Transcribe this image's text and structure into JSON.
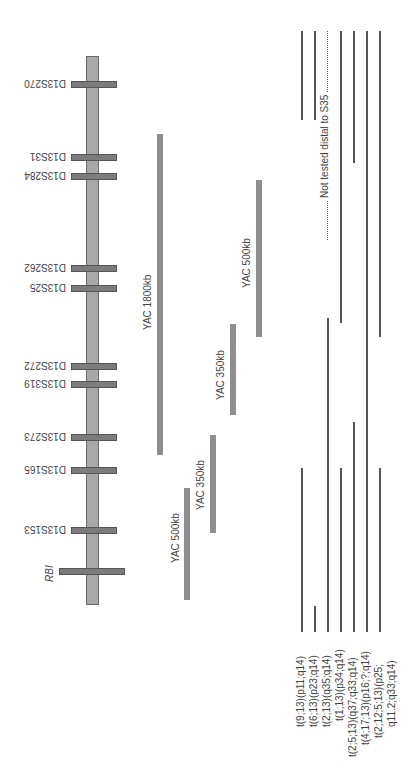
{
  "diagram": {
    "type": "chromosome-map",
    "chromosome": {
      "top": 56,
      "bottom": 605,
      "color": "#a9a9a9"
    },
    "markers": [
      {
        "label": "D13S270",
        "y": 84
      },
      {
        "label": "D13S31",
        "y": 157
      },
      {
        "label": "D13S284",
        "y": 176
      },
      {
        "label": "D13S262",
        "y": 268
      },
      {
        "label": "D13S25",
        "y": 288
      },
      {
        "label": "D13S272",
        "y": 366
      },
      {
        "label": "D13S319",
        "y": 384
      },
      {
        "label": "D13S273",
        "y": 437
      },
      {
        "label": "D13S165",
        "y": 470
      },
      {
        "label": "D13S153",
        "y": 530
      }
    ],
    "gene": {
      "label": "RBI",
      "y": 571
    },
    "yacs": [
      {
        "label": "YAC 1800kb",
        "x": 158,
        "top": 134,
        "bottom": 455
      },
      {
        "label": "YAC 500kb",
        "x": 258,
        "top": 180,
        "bottom": 337
      },
      {
        "label": "YAC 350kb",
        "x": 231,
        "top": 324,
        "bottom": 415
      },
      {
        "label": "YAC 350kb",
        "x": 211,
        "top": 435,
        "bottom": 533
      },
      {
        "label": "YAC 500kb",
        "x": 186,
        "top": 488,
        "bottom": 600
      }
    ],
    "annotation": "Not tested distal to S35",
    "translocations": [
      {
        "label": "t(9;13)(p11;q14)"
      },
      {
        "label": "t(6;13)(p23;q14)"
      },
      {
        "label": "t(2;13)(q35;q14)"
      },
      {
        "label": "t(1;13)(p34;q14)"
      },
      {
        "label": "t(2;5;13)(q37;q33;q14)"
      },
      {
        "label": "t(4;17;13)(p16;?;q14)"
      },
      {
        "label": "t(2;12;5;13)(p25;"
      },
      {
        "label": "q11.2;q33;q14)"
      }
    ]
  }
}
